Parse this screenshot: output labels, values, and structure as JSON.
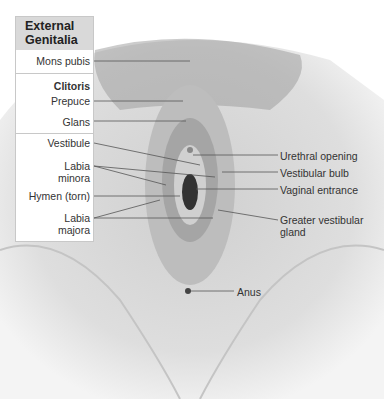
{
  "diagram": {
    "panel_title": "External Genitalia",
    "left_labels": {
      "mons_pubis": "Mons pubis",
      "clitoris_heading": "Clitoris",
      "prepuce": "Prepuce",
      "glans": "Glans",
      "vestibule": "Vestibule",
      "labia_minora": "Labia minora",
      "hymen": "Hymen (torn)",
      "labia_majora": "Labia majora"
    },
    "right_labels": {
      "urethral_opening": "Urethral opening",
      "vestibular_bulb": "Vestibular bulb",
      "vaginal_entrance": "Vaginal entrance",
      "greater_vestibular_gland": "Greater vestibular gland",
      "anus": "Anus"
    }
  }
}
